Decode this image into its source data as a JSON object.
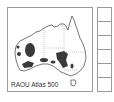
{
  "map": {
    "label": "RAOU Atlas 500",
    "region": "Australia",
    "colors": {
      "outline": "#555555",
      "distribution": "#3a3a3a",
      "state_borders": "#888888",
      "frame": "#9a9a9a"
    }
  },
  "sidebar": {
    "cells": [
      "",
      "",
      "",
      "",
      "",
      ""
    ]
  }
}
